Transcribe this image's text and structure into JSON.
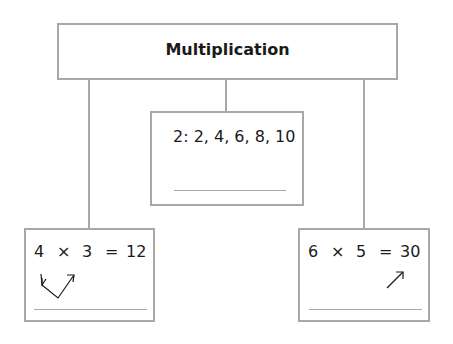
{
  "diagram": {
    "title": "Multiplication",
    "middle_box": {
      "text": "2: 2, 4, 6, 8, 10"
    },
    "left_box": {
      "factor1": "4",
      "op": "×",
      "factor2": "3",
      "eq": "=",
      "product": "12"
    },
    "right_box": {
      "factor1": "6",
      "op": "×",
      "factor2": "5",
      "eq": "=",
      "product": "30"
    }
  },
  "colors": {
    "border": "#a8a8a8",
    "text": "#1a1a1a"
  }
}
